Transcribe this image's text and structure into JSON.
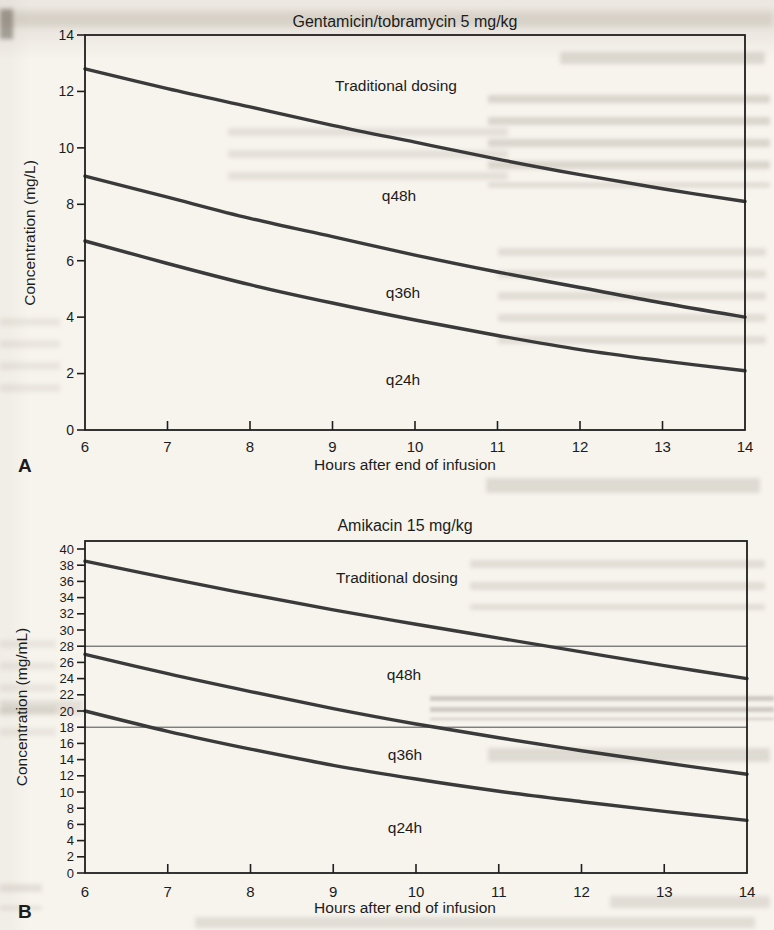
{
  "page": {
    "background": "#f7f4ee",
    "text_color": "#1c1c1c",
    "curve_color": "#3a3a3a",
    "axis_color": "#1f1f1f",
    "reference_line_color": "#4a4a4a"
  },
  "chart_data": [
    {
      "type": "line",
      "panel_label": "A",
      "title": "Gentamicin/tobramycin 5 mg/kg",
      "xlabel": "Hours after end of infusion",
      "ylabel": "Concentration (mg/L)",
      "grid": false,
      "legend_position": "inline-labels",
      "x": [
        6,
        7,
        8,
        9,
        10,
        11,
        12,
        13,
        14
      ],
      "xlim": [
        6,
        14
      ],
      "ylim": [
        0,
        14
      ],
      "xticks": [
        6,
        7,
        8,
        9,
        10,
        11,
        12,
        13,
        14
      ],
      "yticks": [
        0,
        2,
        4,
        6,
        8,
        10,
        12,
        14
      ],
      "series": [
        {
          "name": "Traditional dosing",
          "values": [
            12.8,
            12.1,
            11.45,
            10.8,
            10.2,
            9.6,
            9.05,
            8.55,
            8.1
          ]
        },
        {
          "name": "q48h",
          "values": [
            9.0,
            8.25,
            7.5,
            6.85,
            6.2,
            5.6,
            5.05,
            4.5,
            4.0
          ]
        },
        {
          "name": "q36h",
          "values": [
            6.7,
            5.9,
            5.15,
            4.5,
            3.9,
            3.35,
            2.85,
            2.45,
            2.1
          ]
        }
      ],
      "curve_labels": [
        {
          "text": "Traditional dosing",
          "x": 9.77,
          "y": 12.2
        },
        {
          "text": "q48h",
          "x": 9.8,
          "y": 8.3
        },
        {
          "text": "q36h",
          "x": 9.85,
          "y": 4.85
        },
        {
          "text": "q24h",
          "x": 9.85,
          "y": 1.77
        }
      ],
      "reference_lines": []
    },
    {
      "type": "line",
      "panel_label": "B",
      "title": "Amikacin 15 mg/kg",
      "xlabel": "Hours after end of infusion",
      "ylabel": "Concentration (mg/mL)",
      "grid": false,
      "legend_position": "inline-labels",
      "x": [
        6,
        7,
        8,
        9,
        10,
        11,
        12,
        13,
        14
      ],
      "xlim": [
        6,
        14
      ],
      "ylim": [
        0,
        40
      ],
      "xticks": [
        6,
        7,
        8,
        9,
        10,
        11,
        12,
        13,
        14
      ],
      "yticks": [
        0,
        2,
        4,
        6,
        8,
        10,
        12,
        14,
        16,
        18,
        20,
        22,
        24,
        26,
        28,
        30,
        32,
        34,
        36,
        38,
        40
      ],
      "series": [
        {
          "name": "Traditional dosing",
          "values": [
            38.5,
            36.4,
            34.4,
            32.5,
            30.7,
            29.0,
            27.3,
            25.6,
            24.0
          ]
        },
        {
          "name": "q48h",
          "values": [
            27.0,
            24.6,
            22.4,
            20.3,
            18.4,
            16.7,
            15.1,
            13.6,
            12.2
          ]
        },
        {
          "name": "q36h",
          "values": [
            20.0,
            17.5,
            15.3,
            13.3,
            11.6,
            10.1,
            8.8,
            7.6,
            6.5
          ]
        }
      ],
      "curve_labels": [
        {
          "text": "Traditional dosing",
          "x": 9.77,
          "y": 36.4
        },
        {
          "text": "q48h",
          "x": 9.86,
          "y": 24.4
        },
        {
          "text": "q36h",
          "x": 9.87,
          "y": 14.6
        },
        {
          "text": "q24h",
          "x": 9.87,
          "y": 5.6
        }
      ],
      "reference_lines": [
        28,
        18
      ]
    }
  ]
}
